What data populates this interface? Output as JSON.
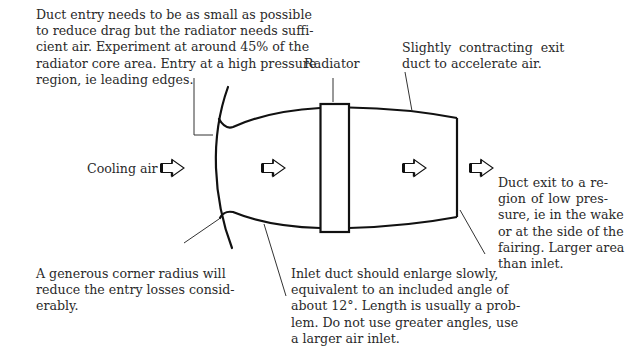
{
  "diagram": {
    "type": "annotated-technical-diagram",
    "labels": {
      "cooling_air": "Cooling air",
      "radiator": "Radiator"
    },
    "annotations": {
      "entry": {
        "lines": [
          "Duct entry needs to be as small as possible",
          "to reduce drag but the radiator needs suffi-",
          "cient air. Experiment at around 45% of the",
          "radiator core area. Entry at a high pressure",
          "region, ie leading edges."
        ]
      },
      "exit_duct": {
        "lines": [
          "Slightly  contracting  exit",
          "duct to accelerate air."
        ]
      },
      "duct_exit": {
        "lines": [
          "Duct exit to a re-",
          "gion of low pres-",
          "sure, ie in the wake",
          "or at the side of the",
          "fairing. Larger area",
          "than inlet."
        ]
      },
      "corner_radius": {
        "lines": [
          "A generous corner radius will",
          "reduce the entry losses consid-",
          "erably."
        ]
      },
      "inlet_duct": {
        "lines": [
          "Inlet duct should enlarge slowly,",
          "equivalent to an included angle of",
          "about 12°. Length is usually a prob-",
          "lem. Do not use greater angles, use",
          "a larger air inlet."
        ]
      }
    },
    "icons": [
      "flow-arrow-icon",
      "flow-arrow-icon",
      "flow-arrow-icon",
      "flow-arrow-icon"
    ],
    "colors": {
      "stroke": "#111111",
      "leader": "#333333",
      "text": "#2a2a2a",
      "background": "#ffffff"
    }
  }
}
